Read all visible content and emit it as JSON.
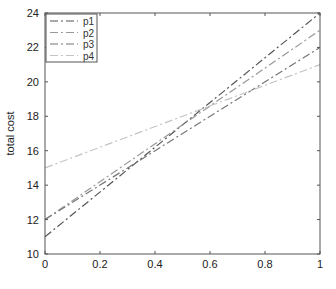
{
  "chart_data": {
    "type": "line",
    "title": "",
    "xlabel": "",
    "ylabel": "total cost",
    "xlim": [
      0,
      1
    ],
    "ylim": [
      10,
      24
    ],
    "x": [
      0,
      1
    ],
    "x_ticks": [
      0,
      0.2,
      0.4,
      0.6,
      0.8,
      1
    ],
    "x_tick_labels": [
      "0",
      "0.2",
      "0.4",
      "0.6",
      "0.8",
      "1"
    ],
    "y_ticks": [
      10,
      12,
      14,
      16,
      18,
      20,
      22,
      24
    ],
    "y_tick_labels": [
      "10",
      "12",
      "14",
      "16",
      "18",
      "20",
      "22",
      "24"
    ],
    "grid": false,
    "legend_position": "upper left",
    "series": [
      {
        "name": "p1",
        "values": [
          11,
          24
        ],
        "color": "#555555",
        "dash": "8,3,2,3"
      },
      {
        "name": "p2",
        "values": [
          12,
          23
        ],
        "color": "#999999",
        "dash": "8,3,2,3"
      },
      {
        "name": "p3",
        "values": [
          12,
          22
        ],
        "color": "#777777",
        "dash": "8,3,2,3"
      },
      {
        "name": "p4",
        "values": [
          15,
          21
        ],
        "color": "#c4c4c4",
        "dash": "8,3,2,3"
      }
    ]
  },
  "plot": {
    "left": 45,
    "top": 13,
    "right": 320,
    "bottom": 254
  }
}
